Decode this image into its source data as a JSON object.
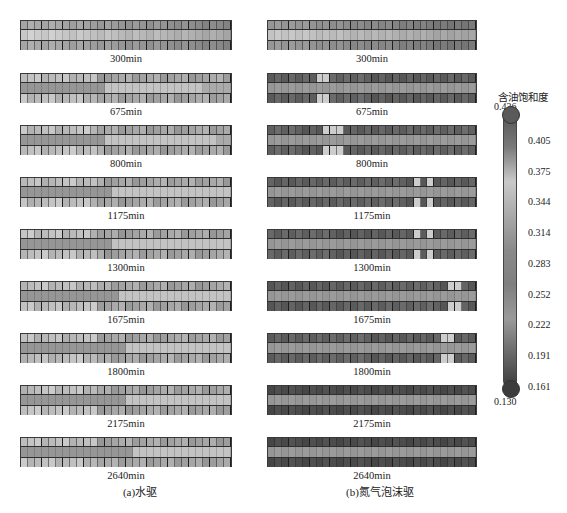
{
  "figure": {
    "colorbar": {
      "title": "含油饱和度",
      "max": "0.436",
      "min": "0.130",
      "ticks": [
        "0.405",
        "0.375",
        "0.344",
        "0.314",
        "0.283",
        "0.252",
        "0.222",
        "0.191",
        "0.161"
      ],
      "gradient": [
        "#555555",
        "#7a7a7a",
        "#c9c9c9",
        "#a9a9a9",
        "#8a8a8a",
        "#7f7f7f",
        "#9a9a9a",
        "#6a6a6a",
        "#3c3c3c"
      ]
    },
    "captions": {
      "left": "(a)水驱",
      "right": "(b)氮气泡沫驱"
    },
    "times": [
      "300min",
      "675min",
      "800min",
      "1175min",
      "1300min",
      "1675min",
      "1800min",
      "2175min",
      "2640min"
    ]
  },
  "chart_data": {
    "type": "heatmap",
    "title": "",
    "colorbar_label": "含油饱和度",
    "colorbar_range": [
      0.13,
      0.436
    ],
    "colorbar_ticks": [
      0.436,
      0.405,
      0.375,
      0.344,
      0.314,
      0.283,
      0.252,
      0.222,
      0.191,
      0.161,
      0.13
    ],
    "panels": [
      {
        "name": "(a)水驱",
        "snapshots": [
          "300min",
          "675min",
          "800min",
          "1175min",
          "1300min",
          "1675min",
          "1800min",
          "2175min",
          "2640min"
        ]
      },
      {
        "name": "(b)氮气泡沫驱",
        "snapshots": [
          "300min",
          "675min",
          "800min",
          "1175min",
          "1300min",
          "1675min",
          "1800min",
          "2175min",
          "2640min"
        ]
      }
    ],
    "grid": {
      "columns": 30,
      "rows": 3
    }
  }
}
